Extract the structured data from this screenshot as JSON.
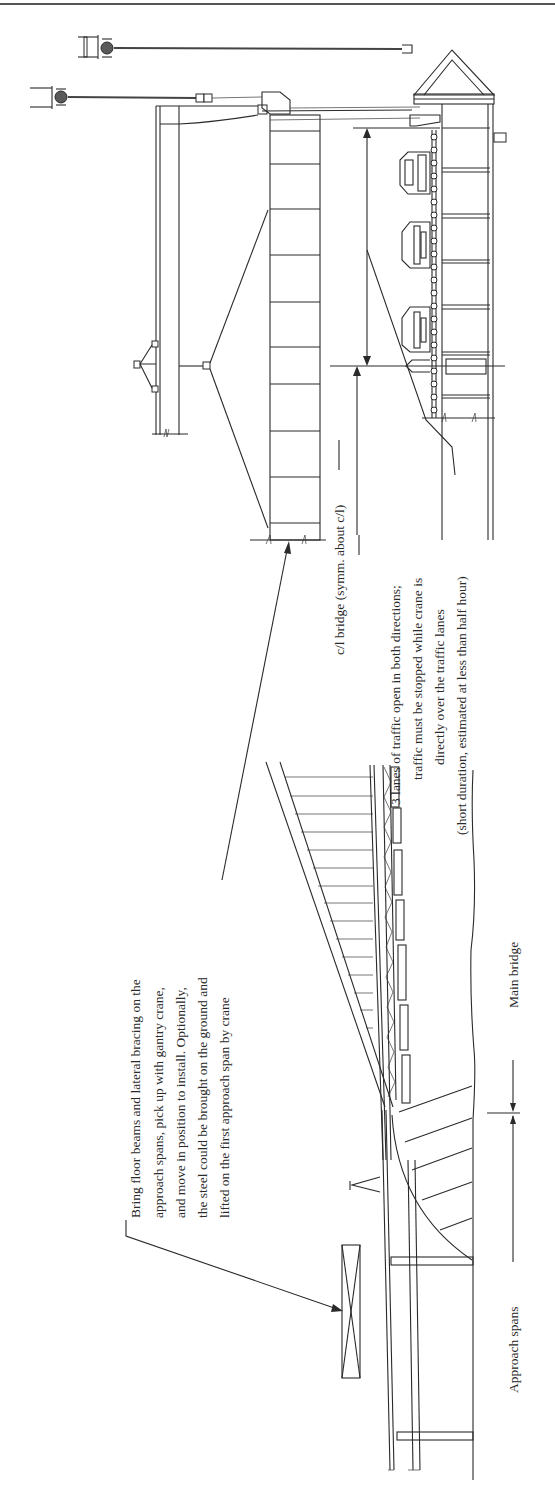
{
  "figure": {
    "orientation": "rotated-90-ccw",
    "line_color": "#2a2a2a",
    "background": "#ffffff"
  },
  "labels": {
    "bring_floor_beams": [
      "Bring floor beams and lateral bracing on the",
      "approach spans, pick up with gantry crane,",
      "and move in position to install. Optionally,",
      "the steel could be brought on the ground and",
      "lifted on the first approach span by crane"
    ],
    "centerline": "c/l bridge (symm. about c/l)",
    "traffic_note": [
      "3 lanes of traffic open in both directions;",
      "traffic must be stopped while crane is",
      "directly over the traffic lanes",
      "(short duration, estimated at less than half hour)"
    ],
    "main_bridge": "Main bridge",
    "approach_spans": "Approach spans"
  },
  "components": {
    "gantry_crane_count": 2,
    "vehicles_shown": 3,
    "floor_beam_panels": 10
  }
}
